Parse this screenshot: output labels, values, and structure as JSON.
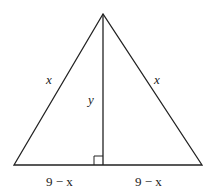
{
  "diagram": {
    "type": "isosceles-triangle-with-altitude",
    "labels": {
      "left_side": "x",
      "right_side": "x",
      "altitude": "y",
      "base_left": "9 − x",
      "base_right": "9 − x"
    },
    "colors": {
      "stroke": "#222222",
      "background": "#ffffff"
    },
    "right_angle_marker": true
  }
}
